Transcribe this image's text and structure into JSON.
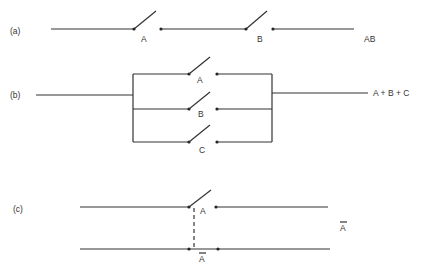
{
  "diagram": {
    "panels": [
      {
        "id": "a",
        "label": "(a)",
        "description": "Switches A and B in series",
        "switches": [
          "A",
          "B"
        ],
        "output": "AB"
      },
      {
        "id": "b",
        "label": "(b)",
        "description": "Switches A, B and C in parallel",
        "switches": [
          "A",
          "B",
          "C"
        ],
        "output": "A + B + C"
      },
      {
        "id": "c",
        "label": "(c)",
        "description": "Ganged switch: A (normally open) mechanically linked to A-bar (normally closed)",
        "switches": [
          "A",
          "Ā"
        ],
        "top_switch": "A",
        "bottom_switch": "A",
        "bottom_switch_overbar": true,
        "output": "A",
        "output_overbar": true
      }
    ],
    "colors": {
      "line": "#333333",
      "background": "#ffffff"
    }
  }
}
